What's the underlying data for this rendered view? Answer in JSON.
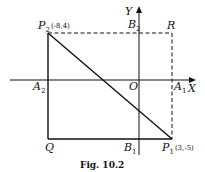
{
  "figure": {
    "caption": "Fig. 10.2",
    "axes": {
      "x_label": "X",
      "y_label": "Y",
      "origin_label": "O"
    },
    "points": {
      "P2": {
        "name": "P",
        "sub": "2",
        "coords": "(-8,4)"
      },
      "P1": {
        "name": "P",
        "sub": "1",
        "coords": "(3,-5)"
      },
      "R": {
        "name": "R"
      },
      "Q": {
        "name": "Q"
      },
      "A2": {
        "name": "A",
        "sub": "2"
      },
      "A1": {
        "name": "A",
        "sub": "1"
      },
      "B2": {
        "name": "B",
        "sub": "2"
      },
      "B1": {
        "name": "B",
        "sub": "1"
      }
    },
    "colors": {
      "ink": "#111111",
      "background": "#ffffff"
    }
  }
}
